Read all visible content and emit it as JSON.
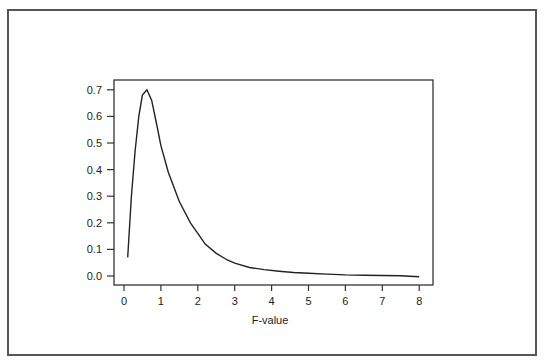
{
  "chart_data": {
    "type": "line",
    "title": "",
    "xlabel": "F-value",
    "ylabel": "",
    "xlim": [
      0,
      8
    ],
    "ylim": [
      0.0,
      0.7
    ],
    "xticks": [
      "0",
      "1",
      "2",
      "3",
      "4",
      "5",
      "6",
      "7",
      "8"
    ],
    "yticks": [
      "0.0",
      "0.1",
      "0.2",
      "0.3",
      "0.4",
      "0.5",
      "0.6",
      "0.7"
    ],
    "grid": false,
    "legend": null,
    "series": [
      {
        "name": "F density",
        "x": [
          0.1,
          0.2,
          0.3,
          0.4,
          0.5,
          0.62,
          0.75,
          0.9,
          1.0,
          1.2,
          1.5,
          1.8,
          2.0,
          2.2,
          2.5,
          2.8,
          3.0,
          3.4,
          3.8,
          4.2,
          4.6,
          5.0,
          5.5,
          6.0,
          6.5,
          7.0,
          7.5,
          8.0
        ],
        "values": [
          0.07,
          0.3,
          0.47,
          0.6,
          0.68,
          0.7,
          0.66,
          0.56,
          0.49,
          0.39,
          0.28,
          0.2,
          0.16,
          0.12,
          0.085,
          0.06,
          0.048,
          0.032,
          0.024,
          0.018,
          0.013,
          0.01,
          0.007,
          0.004,
          0.003,
          0.002,
          0.001,
          -0.003
        ]
      }
    ]
  }
}
